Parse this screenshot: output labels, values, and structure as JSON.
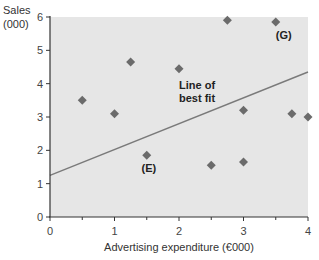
{
  "chart_data": {
    "type": "scatter",
    "title": "",
    "xlabel": "Advertising expenditure (€000)",
    "ylabel": "Sales\n(000)",
    "ylabel_lines": [
      "Sales",
      "(000)"
    ],
    "xlim": [
      0,
      4
    ],
    "ylim": [
      0,
      6
    ],
    "x_ticks": [
      0,
      1,
      2,
      3,
      4
    ],
    "x_minor_ticks": [
      0.5,
      1.5,
      2.5,
      3.5
    ],
    "y_ticks": [
      0,
      1,
      2,
      3,
      4,
      5,
      6
    ],
    "grid": false,
    "background": "#e6e6e6",
    "marker_color": "#6b6b6b",
    "line_color": "#7a7a7a",
    "series": [
      {
        "name": "Observations",
        "points": [
          {
            "x": 0.5,
            "y": 3.5
          },
          {
            "x": 1.0,
            "y": 3.1
          },
          {
            "x": 1.25,
            "y": 4.65
          },
          {
            "x": 1.5,
            "y": 1.85,
            "label": "(E)"
          },
          {
            "x": 2.0,
            "y": 4.45
          },
          {
            "x": 2.5,
            "y": 1.55
          },
          {
            "x": 2.75,
            "y": 5.9
          },
          {
            "x": 3.0,
            "y": 3.2
          },
          {
            "x": 3.0,
            "y": 1.65
          },
          {
            "x": 3.5,
            "y": 5.85,
            "label": "(G)"
          },
          {
            "x": 3.75,
            "y": 3.1
          },
          {
            "x": 4.0,
            "y": 3.0
          }
        ]
      },
      {
        "name": "Line of best fit",
        "type": "line",
        "points": [
          {
            "x": 0,
            "y": 1.25
          },
          {
            "x": 4,
            "y": 4.35
          }
        ]
      }
    ],
    "annotations": [
      {
        "text": "Line of",
        "x": 2.0,
        "y": 3.85
      },
      {
        "text": "best fit",
        "x": 2.0,
        "y": 3.45
      },
      {
        "text": "(E)",
        "x": 1.42,
        "y": 1.35
      },
      {
        "text": "(G)",
        "x": 3.5,
        "y": 5.35
      }
    ],
    "legend": null
  }
}
